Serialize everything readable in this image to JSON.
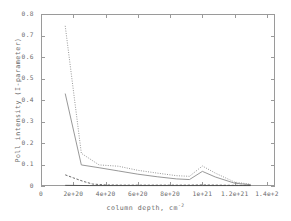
{
  "chart_data": {
    "type": "line",
    "title": "",
    "xlabel": "column depth, cm",
    "xlabel_sup": "-2",
    "ylabel": "Poll intensity (I-parameter)",
    "xlim": [
      0,
      1.45e+21
    ],
    "ylim": [
      0,
      0.8
    ],
    "grid": false,
    "legend": "none",
    "xticks": [
      {
        "value": 0,
        "label": "0"
      },
      {
        "value": 2e+20,
        "label": "2e+20"
      },
      {
        "value": 4e+20,
        "label": "4e+20"
      },
      {
        "value": 6e+20,
        "label": "6e+20"
      },
      {
        "value": 8e+20,
        "label": "8e+20"
      },
      {
        "value": 1e+21,
        "label": "1e+21"
      },
      {
        "value": 1.2e+21,
        "label": "1.2e+21"
      },
      {
        "value": 1.4e+21,
        "label": "1.4e+2"
      }
    ],
    "yticks": [
      {
        "value": 0,
        "label": "0"
      },
      {
        "value": 0.1,
        "label": "0.1"
      },
      {
        "value": 0.2,
        "label": "0.2"
      },
      {
        "value": 0.3,
        "label": "0.3"
      },
      {
        "value": 0.4,
        "label": "0.4"
      },
      {
        "value": 0.5,
        "label": "0.5"
      },
      {
        "value": 0.6,
        "label": "0.6"
      },
      {
        "value": 0.7,
        "label": "0.7"
      },
      {
        "value": 0.8,
        "label": "0.8"
      }
    ],
    "series": [
      {
        "name": "series-1-upper",
        "style": "dotted",
        "color": "#8c8c8c",
        "x": [
          1.5e+20,
          2.5e+20,
          3.6e+20,
          4.8e+20,
          6e+20,
          7.2e+20,
          8.4e+20,
          9.2e+20,
          1e+21,
          1.08e+21,
          1.2e+21,
          1.3e+21
        ],
        "y": [
          0.745,
          0.152,
          0.098,
          0.092,
          0.073,
          0.06,
          0.048,
          0.045,
          0.093,
          0.06,
          0.018,
          0.008
        ]
      },
      {
        "name": "series-2-middle",
        "style": "solid",
        "color": "#8c8c8c",
        "x": [
          1.5e+20,
          2.5e+20,
          3.6e+20,
          4.8e+20,
          6e+20,
          7.2e+20,
          8.4e+20,
          9.2e+20,
          1e+21,
          1.08e+21,
          1.2e+21,
          1.3e+21
        ],
        "y": [
          0.43,
          0.098,
          0.085,
          0.07,
          0.055,
          0.043,
          0.033,
          0.03,
          0.068,
          0.042,
          0.013,
          0.006
        ]
      },
      {
        "name": "series-3-low",
        "style": "dashed",
        "color": "#5a5a5a",
        "x": [
          1.5e+20,
          2e+20,
          2.6e+20,
          3.2e+20,
          4e+20,
          5e+20,
          6e+20,
          7e+20,
          8e+20,
          9e+20,
          1e+21,
          1.1e+21,
          1.2e+21,
          1.3e+21
        ],
        "y": [
          0.052,
          0.038,
          0.022,
          0.009,
          0.005,
          0.004,
          0.004,
          0.004,
          0.004,
          0.004,
          0.005,
          0.004,
          0.003,
          0.003
        ]
      },
      {
        "name": "series-4-baseline",
        "style": "solid",
        "color": "#4a4a4a",
        "x": [
          1.5e+20,
          3e+20,
          4.5e+20,
          6e+20,
          7.5e+20,
          9e+20,
          1e+21,
          1.15e+21,
          1.3e+21
        ],
        "y": [
          0.003,
          0.002,
          0.002,
          0.002,
          0.002,
          0.002,
          0.002,
          0.002,
          0.002
        ]
      }
    ]
  }
}
